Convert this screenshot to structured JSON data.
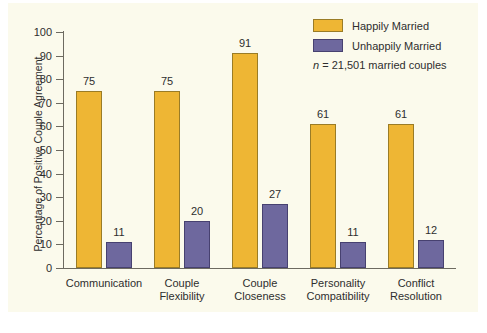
{
  "chart_data": {
    "type": "bar",
    "title": "",
    "xlabel": "",
    "ylabel": "Percentage of Positive Couple Agreement",
    "ylim": [
      0,
      100
    ],
    "ytick_step": 10,
    "yticks": [
      100,
      90,
      80,
      70,
      60,
      50,
      40,
      30,
      20,
      10,
      0
    ],
    "grid": false,
    "legend_position": "top-right",
    "categories": [
      "Communication",
      "Couple\nFlexibility",
      "Couple\nCloseness",
      "Personality\nCompatibility",
      "Conflict\nResolution"
    ],
    "category_lines": [
      [
        "Communication",
        ""
      ],
      [
        "Couple",
        "Flexibility"
      ],
      [
        "Couple",
        "Closeness"
      ],
      [
        "Personality",
        "Compatibility"
      ],
      [
        "Conflict",
        "Resolution"
      ]
    ],
    "series": [
      {
        "name": "Happily Married",
        "color": "#eeb634",
        "values": [
          75,
          75,
          91,
          61,
          61
        ]
      },
      {
        "name": "Unhappily Married",
        "color": "#6e689e",
        "values": [
          11,
          20,
          27,
          11,
          12
        ]
      }
    ],
    "annotation": {
      "n_symbol": "n",
      "n_text": " = 21,501 married couples"
    }
  },
  "colors": {
    "happy": "#eeb634",
    "unhappy": "#6e689e",
    "panel": "#fbfaec",
    "axis": "#6d6a60",
    "text": "#2e2e2e"
  }
}
